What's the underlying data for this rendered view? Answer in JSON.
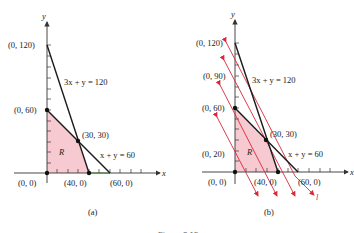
{
  "figure": {
    "caption_partial": "Figure 3.15",
    "panels": [
      {
        "id": "a",
        "label": "(a)",
        "axis_x": "x",
        "axis_y": "y",
        "points": [
          "(0, 120)",
          "(0, 60)",
          "(30, 30)",
          "(0, 0)",
          "(40, 0)",
          "(60, 0)"
        ],
        "lines": [
          "3x + y = 120",
          "x + y = 60"
        ],
        "region": "R"
      },
      {
        "id": "b",
        "label": "(b)",
        "axis_x": "x",
        "axis_y": "y",
        "points": [
          "(0, 120)",
          "(0, 90)",
          "(0, 60)",
          "(0, 20)",
          "(30, 30)",
          "(0, 0)",
          "(40, 0)",
          "(60, 0)"
        ],
        "lines": [
          "3x + y = 120",
          "x + y = 60"
        ],
        "region": "R",
        "level_line_label": "l"
      }
    ]
  },
  "colors": {
    "region_fill": "#f7c9d0",
    "constraint_line": "#1a1a1a",
    "level_line": "#d8283c",
    "axis": "#333333",
    "x_segment_highlight": "#7fd36f"
  }
}
